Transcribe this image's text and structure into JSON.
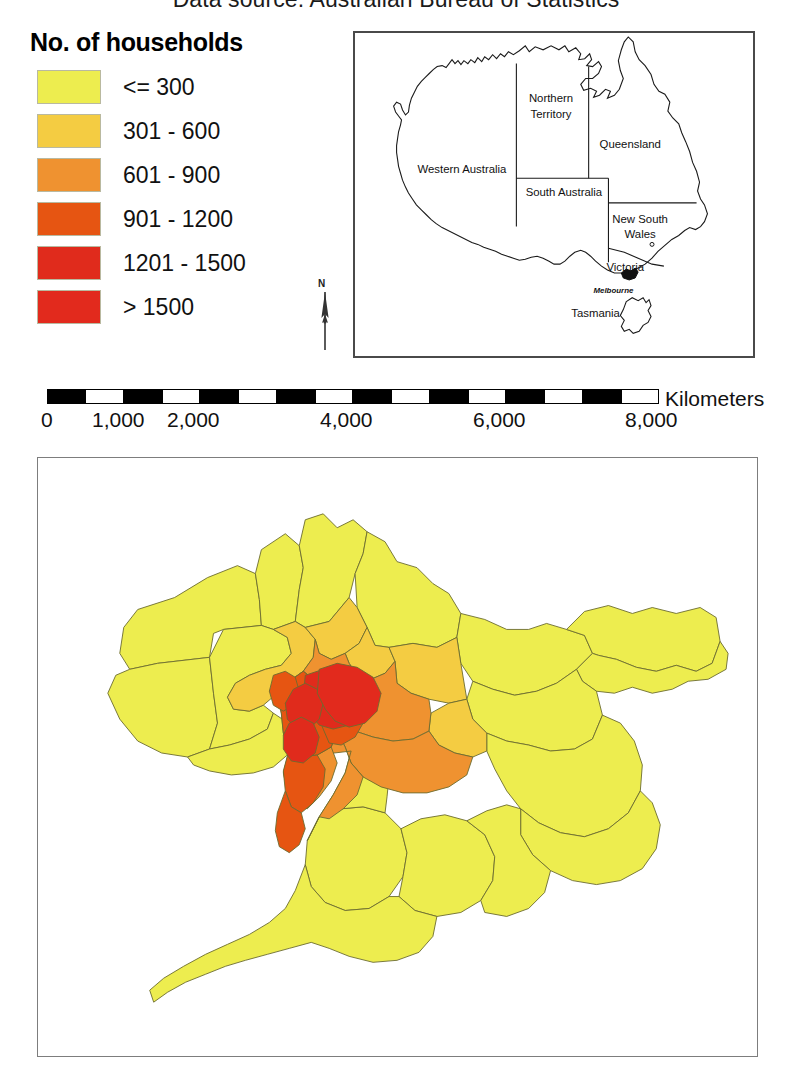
{
  "title": "Data source: Australian Bureau of Statistics",
  "legend": {
    "title": "No. of households",
    "items": [
      {
        "label": "<= 300",
        "color": "#eded4f"
      },
      {
        "label": "301 - 600",
        "color": "#f4cc42"
      },
      {
        "label": "601 - 900",
        "color": "#ef9230"
      },
      {
        "label": "901 - 1200",
        "color": "#e65512"
      },
      {
        "label": "1201 - 1500",
        "color": "#e02b1c"
      },
      {
        "label": "> 1500",
        "color": "#e22a1d"
      }
    ]
  },
  "north_arrow": {
    "label": "N"
  },
  "inset_map": {
    "labels": [
      {
        "text": "Northern Territory",
        "lines": [
          "Northern",
          "Territory"
        ]
      },
      {
        "text": "Queensland",
        "lines": [
          "Queensland"
        ]
      },
      {
        "text": "Western Australia",
        "lines": [
          "Western Australia"
        ]
      },
      {
        "text": "South Australia",
        "lines": [
          "South Australia"
        ]
      },
      {
        "text": "New South Wales",
        "lines": [
          "New South",
          "Wales"
        ]
      },
      {
        "text": "Victoria",
        "lines": [
          "Victoria"
        ]
      },
      {
        "text": "Tasmania",
        "lines": [
          "Tasmania"
        ]
      }
    ],
    "city_marker": "Melbourne"
  },
  "scalebar": {
    "unit": "Kilometers",
    "ticks": [
      "0",
      "1,000",
      "2,000",
      "4,000",
      "6,000",
      "8,000"
    ],
    "tick_values": [
      0,
      1000,
      2000,
      4000,
      6000,
      8000
    ],
    "max": 8000
  },
  "chart_data": {
    "type": "map",
    "title": "Data source: Australian Bureau of Statistics",
    "map_subject": "Melbourne metropolitan statistical areas",
    "variable": "No. of households",
    "classes": [
      {
        "label": "<= 300",
        "min": 0,
        "max": 300,
        "color": "#eded4f"
      },
      {
        "label": "301 - 600",
        "min": 301,
        "max": 600,
        "color": "#f4cc42"
      },
      {
        "label": "601 - 900",
        "min": 601,
        "max": 900,
        "color": "#ef9230"
      },
      {
        "label": "901 - 1200",
        "min": 901,
        "max": 1200,
        "color": "#e65512"
      },
      {
        "label": "1201 - 1500",
        "min": 1201,
        "max": 1500,
        "color": "#e02b1c"
      },
      {
        "label": "> 1500",
        "min": 1501,
        "max": null,
        "color": "#e22a1d"
      }
    ],
    "legend_position": "top-left",
    "scalebar_unit": "Kilometers",
    "scalebar_ticks": [
      0,
      1000,
      2000,
      4000,
      6000,
      8000
    ]
  }
}
